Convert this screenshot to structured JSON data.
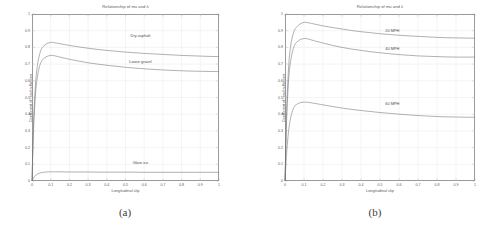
{
  "figure": {
    "panels": [
      {
        "key": "a",
        "subcaption": "(a)",
        "chart_data": {
          "type": "line",
          "title": "Relationship of mu and λ",
          "xlabel": "Longitudinal slip",
          "ylabel": "Coefficient of road adhesion",
          "xlim": [
            0,
            1
          ],
          "ylim": [
            0,
            1
          ],
          "xticks": [
            "0",
            "0.1",
            "0.2",
            "0.3",
            "0.4",
            "0.5",
            "0.6",
            "0.7",
            "0.8",
            "0.9",
            "1"
          ],
          "yticks": [
            "0",
            "0.1",
            "0.2",
            "0.3",
            "0.4",
            "0.5",
            "0.6",
            "0.7",
            "0.8",
            "0.9",
            "1"
          ],
          "grid": true,
          "legend_position": "inline-annotations",
          "series": [
            {
              "name": "Dry asphalt",
              "label_x": 0.58,
              "label_y": 0.875,
              "peak_slip": 0.105,
              "peak_mu": 0.83,
              "tail_mu": 0.745,
              "x": [
                0,
                0.005,
                0.01,
                0.02,
                0.03,
                0.04,
                0.05,
                0.06,
                0.08,
                0.1,
                0.105,
                0.12,
                0.15,
                0.2,
                0.25,
                0.3,
                0.35,
                0.4,
                0.45,
                0.5,
                0.55,
                0.6,
                0.65,
                0.7,
                0.75,
                0.8,
                0.85,
                0.9,
                0.95,
                1
              ],
              "y": [
                0,
                0.22,
                0.4,
                0.6,
                0.7,
                0.755,
                0.79,
                0.805,
                0.823,
                0.83,
                0.83,
                0.828,
                0.822,
                0.812,
                0.803,
                0.795,
                0.788,
                0.782,
                0.777,
                0.772,
                0.768,
                0.764,
                0.761,
                0.758,
                0.755,
                0.752,
                0.75,
                0.748,
                0.746,
                0.745
              ]
            },
            {
              "name": "Loose gravel",
              "label_x": 0.58,
              "label_y": 0.72,
              "peak_slip": 0.105,
              "peak_mu": 0.752,
              "tail_mu": 0.655,
              "x": [
                0,
                0.005,
                0.01,
                0.02,
                0.03,
                0.04,
                0.05,
                0.06,
                0.08,
                0.1,
                0.105,
                0.12,
                0.15,
                0.2,
                0.25,
                0.3,
                0.35,
                0.4,
                0.45,
                0.5,
                0.55,
                0.6,
                0.65,
                0.7,
                0.75,
                0.8,
                0.85,
                0.9,
                0.95,
                1
              ],
              "y": [
                0,
                0.19,
                0.35,
                0.54,
                0.63,
                0.685,
                0.715,
                0.731,
                0.746,
                0.752,
                0.752,
                0.75,
                0.742,
                0.729,
                0.718,
                0.708,
                0.7,
                0.693,
                0.687,
                0.681,
                0.676,
                0.672,
                0.668,
                0.665,
                0.662,
                0.66,
                0.658,
                0.657,
                0.656,
                0.655
              ]
            },
            {
              "name": "Glare ice",
              "label_x": 0.58,
              "label_y": 0.115,
              "peak_slip": 0.12,
              "peak_mu": 0.055,
              "tail_mu": 0.052,
              "x": [
                0,
                0.005,
                0.01,
                0.02,
                0.03,
                0.04,
                0.05,
                0.06,
                0.08,
                0.1,
                0.12,
                0.15,
                0.2,
                0.25,
                0.3,
                0.35,
                0.4,
                0.45,
                0.5,
                0.55,
                0.6,
                0.65,
                0.7,
                0.75,
                0.8,
                0.85,
                0.9,
                0.95,
                1
              ],
              "y": [
                0,
                0.012,
                0.022,
                0.034,
                0.042,
                0.047,
                0.05,
                0.052,
                0.054,
                0.055,
                0.055,
                0.055,
                0.054,
                0.054,
                0.054,
                0.053,
                0.053,
                0.053,
                0.053,
                0.053,
                0.052,
                0.052,
                0.052,
                0.052,
                0.052,
                0.052,
                0.052,
                0.052,
                0.052
              ]
            }
          ]
        }
      },
      {
        "key": "b",
        "subcaption": "(b)",
        "chart_data": {
          "type": "line",
          "title": "Relationship of mu and λ",
          "xlabel": "Longitudinal slip",
          "ylabel": "Coefficient of road adhesion",
          "xlim": [
            0,
            1
          ],
          "ylim": [
            0,
            1
          ],
          "xticks": [
            "0",
            "0.1",
            "0.2",
            "0.3",
            "0.4",
            "0.5",
            "0.6",
            "0.7",
            "0.8",
            "0.9",
            "1"
          ],
          "yticks": [
            "0",
            "0.1",
            "0.2",
            "0.3",
            "0.4",
            "0.5",
            "0.6",
            "0.7",
            "0.8",
            "0.9",
            "1"
          ],
          "grid": true,
          "legend_position": "inline-annotations",
          "series": [
            {
              "name": "20 MPH",
              "label_x": 0.565,
              "label_y": 0.905,
              "peak_slip": 0.105,
              "peak_mu": 0.95,
              "tail_mu": 0.855,
              "x": [
                0,
                0.005,
                0.01,
                0.02,
                0.03,
                0.04,
                0.05,
                0.06,
                0.08,
                0.1,
                0.105,
                0.12,
                0.15,
                0.2,
                0.25,
                0.3,
                0.35,
                0.4,
                0.45,
                0.5,
                0.55,
                0.6,
                0.65,
                0.7,
                0.75,
                0.8,
                0.85,
                0.9,
                0.95,
                1
              ],
              "y": [
                0,
                0.26,
                0.47,
                0.7,
                0.81,
                0.868,
                0.903,
                0.92,
                0.941,
                0.95,
                0.95,
                0.948,
                0.941,
                0.929,
                0.919,
                0.91,
                0.901,
                0.894,
                0.888,
                0.882,
                0.877,
                0.873,
                0.869,
                0.866,
                0.863,
                0.86,
                0.858,
                0.857,
                0.856,
                0.855
              ]
            },
            {
              "name": "40 MPH",
              "label_x": 0.565,
              "label_y": 0.795,
              "peak_slip": 0.105,
              "peak_mu": 0.853,
              "tail_mu": 0.742,
              "x": [
                0,
                0.005,
                0.01,
                0.02,
                0.03,
                0.04,
                0.05,
                0.06,
                0.08,
                0.1,
                0.105,
                0.12,
                0.15,
                0.2,
                0.25,
                0.3,
                0.35,
                0.4,
                0.45,
                0.5,
                0.55,
                0.6,
                0.65,
                0.7,
                0.75,
                0.8,
                0.85,
                0.9,
                0.95,
                1
              ],
              "y": [
                0,
                0.22,
                0.41,
                0.62,
                0.72,
                0.778,
                0.812,
                0.829,
                0.847,
                0.853,
                0.853,
                0.851,
                0.841,
                0.826,
                0.812,
                0.8,
                0.79,
                0.782,
                0.774,
                0.768,
                0.762,
                0.757,
                0.753,
                0.749,
                0.747,
                0.745,
                0.743,
                0.742,
                0.742,
                0.742
              ]
            },
            {
              "name": "60 MPH",
              "label_x": 0.565,
              "label_y": 0.465,
              "peak_slip": 0.11,
              "peak_mu": 0.472,
              "tail_mu": 0.382,
              "x": [
                0,
                0.005,
                0.01,
                0.02,
                0.03,
                0.04,
                0.05,
                0.06,
                0.08,
                0.1,
                0.11,
                0.12,
                0.15,
                0.2,
                0.25,
                0.3,
                0.35,
                0.4,
                0.45,
                0.5,
                0.55,
                0.6,
                0.65,
                0.7,
                0.75,
                0.8,
                0.85,
                0.9,
                0.95,
                1
              ],
              "y": [
                0,
                0.1,
                0.19,
                0.31,
                0.38,
                0.422,
                0.446,
                0.458,
                0.469,
                0.472,
                0.472,
                0.471,
                0.466,
                0.456,
                0.446,
                0.437,
                0.429,
                0.422,
                0.416,
                0.41,
                0.405,
                0.4,
                0.396,
                0.392,
                0.389,
                0.386,
                0.384,
                0.383,
                0.382,
                0.382
              ]
            }
          ]
        }
      }
    ]
  },
  "style": {
    "curve_color": "#6f6f6f",
    "axis_color": "#9a9a9a",
    "grid_color": "#e2e2e2",
    "text_color": "#5a5a5a",
    "background": "#ffffff"
  }
}
